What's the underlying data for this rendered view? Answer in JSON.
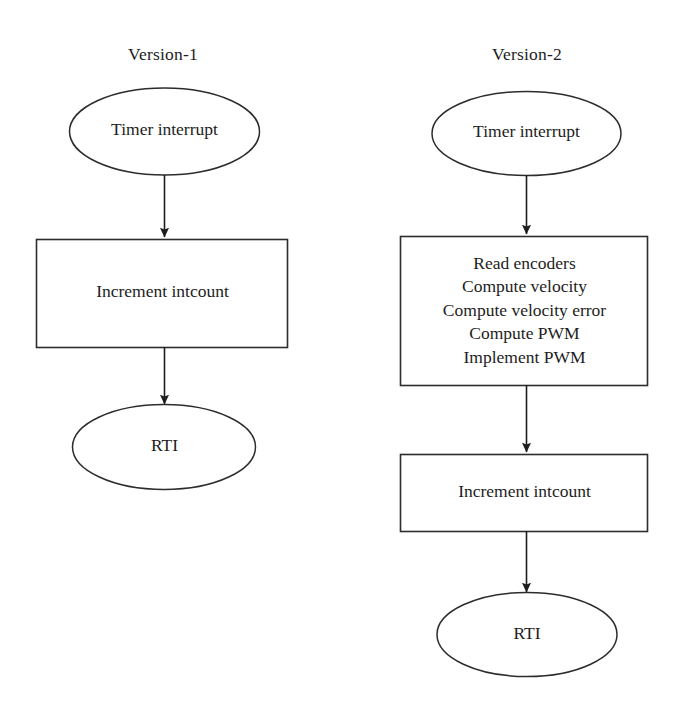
{
  "figure": {
    "type": "flowchart",
    "background_color": "#ffffff",
    "stroke_color": "#2a2a2a",
    "text_color": "#1d1d1d"
  },
  "columns": [
    {
      "id": "version-1",
      "title": "Version-1",
      "nodes": [
        {
          "id": "v1-start",
          "shape": "ellipse",
          "lines": [
            "Timer interrupt"
          ]
        },
        {
          "id": "v1-process",
          "shape": "rectangle",
          "lines": [
            "Increment intcount"
          ]
        },
        {
          "id": "v1-end",
          "shape": "ellipse",
          "lines": [
            "RTI"
          ]
        }
      ],
      "connectors": [
        {
          "from": "v1-start",
          "to": "v1-process",
          "arrowhead": "solid-triangle"
        },
        {
          "from": "v1-process",
          "to": "v1-end",
          "arrowhead": "solid-triangle"
        }
      ]
    },
    {
      "id": "version-2",
      "title": "Version-2",
      "nodes": [
        {
          "id": "v2-start",
          "shape": "ellipse",
          "lines": [
            "Timer interrupt"
          ]
        },
        {
          "id": "v2-process-main",
          "shape": "rectangle",
          "lines": [
            "Read encoders",
            "Compute velocity",
            "Compute velocity error",
            "Compute PWM",
            "Implement PWM"
          ]
        },
        {
          "id": "v2-process-count",
          "shape": "rectangle",
          "lines": [
            "Increment intcount"
          ]
        },
        {
          "id": "v2-end",
          "shape": "ellipse",
          "lines": [
            "RTI"
          ]
        }
      ],
      "connectors": [
        {
          "from": "v2-start",
          "to": "v2-process-main",
          "arrowhead": "solid-triangle"
        },
        {
          "from": "v2-process-main",
          "to": "v2-process-count",
          "arrowhead": "solid-triangle"
        },
        {
          "from": "v2-process-count",
          "to": "v2-end",
          "arrowhead": "solid-triangle"
        }
      ]
    }
  ]
}
